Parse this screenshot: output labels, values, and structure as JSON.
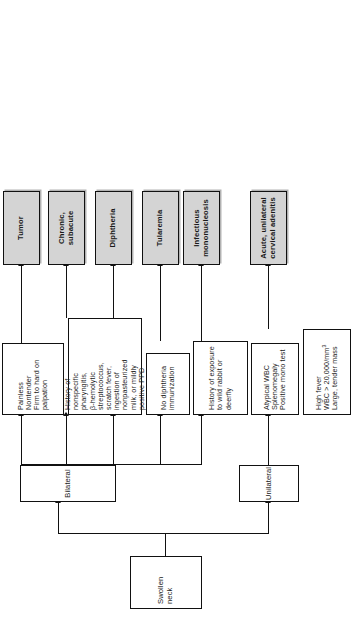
{
  "figure": {
    "orientation": "rotated-90-ccw",
    "root": {
      "label": "Swollen neck"
    },
    "branches": [
      {
        "id": "bilateral",
        "label": "Bilateral"
      },
      {
        "id": "unilateral",
        "label": "Unilateral"
      }
    ],
    "criteria": [
      {
        "id": "tumor-criteria",
        "text": "Painless\nNontender\nFirm to hard on\npalpation"
      },
      {
        "id": "chronic-criteria",
        "text": "History of\nnonspecific\npharyngitis,\nβ-hemolytic\nstreptococcus,\nscratch fever,\ningestion of\nnonpasteurized\nmilk, or mildly\npositive PPD"
      },
      {
        "id": "diphtheria-criteria",
        "text": "No diphtheria\nimmunization"
      },
      {
        "id": "tularemia-criteria",
        "text": "History of exposure\nto wild rabbit or\ndeerfly"
      },
      {
        "id": "mono-criteria",
        "text": "Atypical WBC\nSplenomegaly\nPositive mono test"
      },
      {
        "id": "adenitis-criteria",
        "line1": "High fever",
        "line2_prefix": "WBC > 20,000/mm",
        "line2_sup": "3",
        "line3": "Large, tender mass"
      }
    ],
    "outcomes": [
      {
        "id": "tumor",
        "label": "Tumor"
      },
      {
        "id": "chronic-subacute",
        "label": "Chronic,\nsubacute"
      },
      {
        "id": "diphtheria",
        "label": "Diphtheria"
      },
      {
        "id": "tularemia",
        "label": "Tularemia"
      },
      {
        "id": "infectious-mononucleosis",
        "label": "Infectious\nmononucleosis"
      },
      {
        "id": "acute-unilateral-cervical-adenitis",
        "label": "Acute, unilateral\ncervical adenitis"
      }
    ],
    "colors": {
      "outcome_fill": "#d4d4d4",
      "line": "#111111",
      "box_fill": "#ffffff"
    }
  }
}
